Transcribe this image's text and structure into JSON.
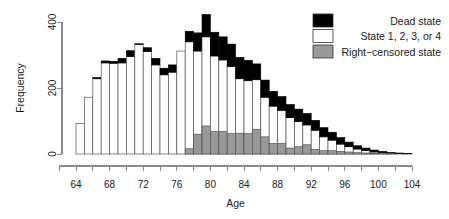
{
  "chart_data": {
    "type": "bar",
    "subtype": "stacked-histogram",
    "title": "",
    "xlabel": "Age",
    "ylabel": "Frequency",
    "xlim": [
      62,
      105
    ],
    "ylim": [
      0,
      430
    ],
    "grid": false,
    "bin_width": 1,
    "x_ticks": [
      64,
      68,
      72,
      76,
      80,
      84,
      88,
      92,
      96,
      100,
      104
    ],
    "x_minor_ticks": [
      62,
      64,
      66,
      68,
      70,
      72,
      74,
      76,
      78,
      80,
      82,
      84,
      86,
      88,
      90,
      92,
      94,
      96,
      98,
      100,
      102,
      104
    ],
    "y_ticks": [
      0,
      200,
      400
    ],
    "legend": {
      "position": "top-right",
      "entries": [
        {
          "label": "Dead state",
          "color": "#000000"
        },
        {
          "label": "State 1, 2, 3, or 4",
          "color": "#ffffff"
        },
        {
          "label": "Right−censored state",
          "color": "#999999"
        }
      ]
    },
    "categories": [
      64,
      65,
      66,
      67,
      68,
      69,
      70,
      71,
      72,
      73,
      74,
      75,
      76,
      77,
      78,
      79,
      80,
      81,
      82,
      83,
      84,
      85,
      86,
      87,
      88,
      89,
      90,
      91,
      92,
      93,
      94,
      95,
      96,
      97,
      98,
      99,
      100,
      101,
      102,
      103
    ],
    "series": [
      {
        "name": "Right−censored state",
        "color": "#999999",
        "values": [
          0,
          0,
          0,
          0,
          0,
          0,
          0,
          0,
          0,
          0,
          0,
          0,
          0,
          16,
          60,
          85,
          68,
          68,
          62,
          63,
          62,
          75,
          52,
          32,
          32,
          18,
          22,
          28,
          14,
          10,
          10,
          8,
          6,
          4,
          3,
          2,
          1,
          1,
          0,
          0
        ]
      },
      {
        "name": "State 1, 2, 3, or 4",
        "color": "#ffffff",
        "values": [
          92,
          172,
          228,
          276,
          275,
          276,
          295,
          332,
          310,
          270,
          240,
          248,
          312,
          340,
          312,
          355,
          297,
          285,
          265,
          228,
          222,
          225,
          172,
          145,
          132,
          110,
          98,
          88,
          72,
          52,
          42,
          30,
          22,
          15,
          10,
          6,
          4,
          2,
          1,
          0
        ]
      },
      {
        "name": "Dead state",
        "color": "#000000",
        "values": [
          0,
          0,
          4,
          6,
          6,
          14,
          18,
          2,
          12,
          20,
          20,
          22,
          0,
          32,
          55,
          68,
          72,
          70,
          68,
          65,
          62,
          48,
          52,
          45,
          42,
          40,
          38,
          35,
          30,
          28,
          24,
          20,
          14,
          10,
          8,
          6,
          4,
          3,
          2,
          1
        ]
      }
    ]
  },
  "axes": {
    "x_label": "Age",
    "y_label": "Frequency"
  }
}
